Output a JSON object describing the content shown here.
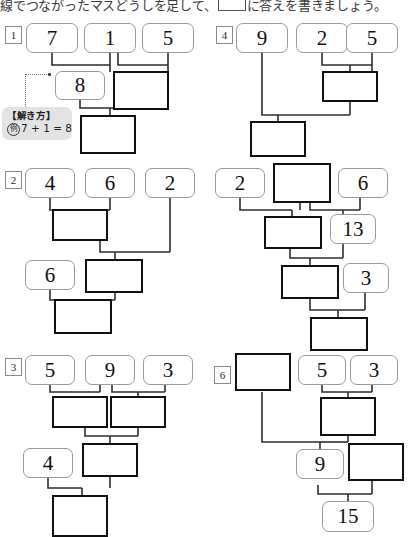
{
  "worksheet": {
    "instruction_pre": "線でつながったマスどうしを足して、",
    "instruction_post": "に答えを書きましょう。",
    "hint": {
      "title": "【解き方】",
      "marker": "例",
      "equation": "7 + 1 = 8"
    },
    "colors": {
      "given_border": "#9a9a9a",
      "answer_border": "#111111",
      "wire": "#2e2e2e",
      "hint_bg": "#e3e3e3",
      "page_bg": "#ffffff"
    }
  },
  "problems": [
    {
      "number": "1",
      "given": [
        "7",
        "1",
        "5",
        "8"
      ],
      "answers": [
        "",
        "",
        ""
      ]
    },
    {
      "number": "2",
      "given": [
        "4",
        "6",
        "2",
        "6"
      ],
      "answers": [
        "",
        "",
        ""
      ]
    },
    {
      "number": "3",
      "given": [
        "5",
        "9",
        "3",
        "4"
      ],
      "answers": [
        "",
        "",
        "",
        ""
      ]
    },
    {
      "number": "4",
      "given": [
        "9",
        "2",
        "5"
      ],
      "answers": [
        "",
        ""
      ]
    },
    {
      "number": "5",
      "given": [
        "2",
        "6",
        "13",
        "3"
      ],
      "answers": [
        "",
        "",
        "",
        ""
      ]
    },
    {
      "number": "6",
      "given": [
        "5",
        "3",
        "9",
        "15"
      ],
      "answers": [
        "",
        "",
        ""
      ]
    }
  ]
}
